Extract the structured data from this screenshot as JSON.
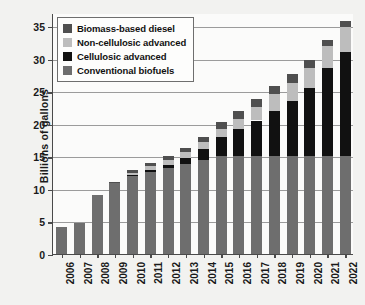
{
  "chart_data": {
    "type": "bar",
    "stacked": true,
    "title": "",
    "xlabel": "",
    "ylabel": "Billions of gallons",
    "ylim": [
      0,
      37
    ],
    "yticks": [
      0,
      5,
      10,
      15,
      20,
      25,
      30,
      35
    ],
    "ytick_labels": [
      "0",
      "5",
      "10",
      "15",
      "20",
      "25",
      "30",
      "35"
    ],
    "grid": true,
    "legend_position": "top-left",
    "categories": [
      "2006",
      "2007",
      "2008",
      "2009",
      "2010",
      "2011",
      "2012",
      "2013",
      "2014",
      "2015",
      "2016",
      "2017",
      "2018",
      "2019",
      "2020",
      "2021",
      "2022"
    ],
    "series": [
      {
        "name": "Conventional biofuels",
        "color": "#6e6e6e",
        "values": [
          4.1,
          4.7,
          9.0,
          10.9,
          12.0,
          12.6,
          13.2,
          13.8,
          14.4,
          15.0,
          15.0,
          15.0,
          15.0,
          15.0,
          15.0,
          15.0,
          15.0
        ]
      },
      {
        "name": "Cellulosic advanced",
        "color": "#111111",
        "values": [
          0.0,
          0.0,
          0.0,
          0.0,
          0.1,
          0.25,
          0.5,
          1.0,
          1.75,
          3.0,
          4.25,
          5.5,
          7.0,
          8.5,
          10.5,
          13.5,
          16.0
        ]
      },
      {
        "name": "Non-cellulosic advanced",
        "color": "#bdbdbd",
        "values": [
          0.0,
          0.0,
          0.0,
          0.0,
          0.35,
          0.6,
          0.8,
          0.9,
          1.0,
          1.2,
          1.5,
          2.0,
          2.5,
          2.8,
          3.0,
          3.4,
          3.8
        ]
      },
      {
        "name": "Biomass-based diesel",
        "color": "#4f4f4f",
        "values": [
          0.0,
          0.0,
          0.0,
          0.1,
          0.4,
          0.5,
          0.5,
          0.6,
          0.75,
          1.0,
          1.2,
          1.25,
          1.3,
          1.4,
          1.3,
          0.9,
          1.0
        ]
      }
    ],
    "legend_entries": [
      {
        "label": "Biomass-based diesel",
        "color": "#4f4f4f"
      },
      {
        "label": "Non-cellulosic advanced",
        "color": "#bdbdbd"
      },
      {
        "label": "Cellulosic advanced",
        "color": "#111111"
      },
      {
        "label": "Conventional biofuels",
        "color": "#6e6e6e"
      }
    ]
  }
}
